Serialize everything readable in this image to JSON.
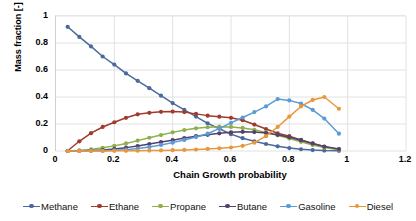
{
  "chart_data": {
    "type": "line",
    "title": "",
    "xlabel": "Chain Growth probability",
    "ylabel": "Mass fraction [-]",
    "xlim": [
      0,
      1.2
    ],
    "ylim": [
      0,
      1
    ],
    "xticks": [
      "0",
      "0.2",
      "0.4",
      "0.6",
      "0.8",
      "1",
      "1.2"
    ],
    "xtick_values": [
      0,
      0.2,
      0.4,
      0.6,
      0.8,
      1,
      1.2
    ],
    "yticks": [
      "0",
      "0.2",
      "0.4",
      "0.6",
      "0.8",
      "1"
    ],
    "ytick_values": [
      0,
      0.2,
      0.4,
      0.6,
      0.8,
      1
    ],
    "grid": "both",
    "legend_position": "bottom",
    "markers": "circle",
    "x": [
      0.04,
      0.08,
      0.12,
      0.16,
      0.2,
      0.24,
      0.28,
      0.32,
      0.36,
      0.4,
      0.44,
      0.48,
      0.52,
      0.56,
      0.6,
      0.64,
      0.68,
      0.72,
      0.76,
      0.8,
      0.84,
      0.88,
      0.92,
      0.97
    ],
    "series": [
      {
        "name": "Methane",
        "color": "#4a6a9c",
        "values": [
          0.92,
          0.845,
          0.775,
          0.7,
          0.64,
          0.575,
          0.52,
          0.465,
          0.41,
          0.355,
          0.305,
          0.255,
          0.205,
          0.165,
          0.125,
          0.095,
          0.072,
          0.052,
          0.035,
          0.022,
          0.013,
          0.007,
          0.003,
          0.001
        ]
      },
      {
        "name": "Ethane",
        "color": "#9e3b2e",
        "values": [
          0.002,
          0.072,
          0.132,
          0.178,
          0.213,
          0.246,
          0.272,
          0.283,
          0.29,
          0.292,
          0.288,
          0.275,
          0.262,
          0.254,
          0.246,
          0.228,
          0.196,
          0.163,
          0.131,
          0.11,
          0.082,
          0.055,
          0.031,
          0.012
        ]
      },
      {
        "name": "Propane",
        "color": "#8faf4a",
        "values": [
          0.0,
          0.004,
          0.012,
          0.024,
          0.038,
          0.056,
          0.077,
          0.098,
          0.118,
          0.138,
          0.155,
          0.168,
          0.176,
          0.18,
          0.178,
          0.171,
          0.157,
          0.138,
          0.117,
          0.093,
          0.068,
          0.045,
          0.025,
          0.01
        ]
      },
      {
        "name": "Butane",
        "color": "#53416e",
        "values": [
          0.0,
          0.001,
          0.003,
          0.007,
          0.015,
          0.025,
          0.037,
          0.052,
          0.066,
          0.08,
          0.096,
          0.11,
          0.12,
          0.131,
          0.138,
          0.142,
          0.14,
          0.133,
          0.12,
          0.102,
          0.08,
          0.056,
          0.033,
          0.014
        ]
      },
      {
        "name": "Gasoline",
        "color": "#5b9bd5",
        "values": [
          0.0,
          0.0,
          0.001,
          0.002,
          0.005,
          0.01,
          0.018,
          0.03,
          0.045,
          0.062,
          0.082,
          0.103,
          0.128,
          0.168,
          0.208,
          0.248,
          0.288,
          0.33,
          0.385,
          0.375,
          0.352,
          0.305,
          0.24,
          0.128
        ]
      },
      {
        "name": "Diesel",
        "color": "#e8973c",
        "values": [
          0.0,
          0.0,
          0.0,
          0.0,
          0.001,
          0.001,
          0.002,
          0.003,
          0.004,
          0.006,
          0.008,
          0.011,
          0.015,
          0.02,
          0.026,
          0.038,
          0.062,
          0.11,
          0.178,
          0.255,
          0.33,
          0.378,
          0.4,
          0.313
        ]
      }
    ]
  },
  "legend": {
    "items": [
      {
        "label": "Methane",
        "color": "#4a6a9c"
      },
      {
        "label": "Ethane",
        "color": "#9e3b2e"
      },
      {
        "label": "Propane",
        "color": "#8faf4a"
      },
      {
        "label": "Butane",
        "color": "#53416e"
      },
      {
        "label": "Gasoline",
        "color": "#5b9bd5"
      },
      {
        "label": "Diesel",
        "color": "#e8973c"
      }
    ]
  },
  "axes": {
    "x_title": "Chain Growth probability",
    "y_title": "Mass fraction [-]"
  },
  "colors": {
    "gridline": "#e2e2e2",
    "axis_line": "#cfcfcf",
    "background": "#ffffff",
    "text": "#000000"
  }
}
